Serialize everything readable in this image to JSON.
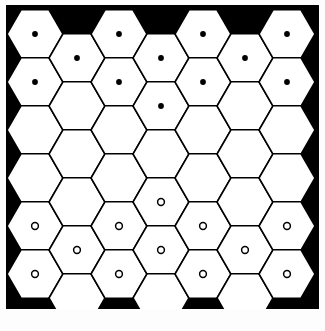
{
  "figure": {
    "background_color": "#000000",
    "cell_fill_color": "#ffffff",
    "cell_stroke_color": "#000000",
    "marker_color": "#000000",
    "panel": {
      "x": 6,
      "y": 5,
      "width": 313,
      "height": 304
    },
    "lattice": {
      "type": "hexagonal",
      "orientation": "pointy-left-right-flat-top",
      "columns": 7,
      "rows": 6,
      "column_pitch": 42,
      "row_pitch": 48,
      "hex_radius": 28,
      "origin_x": 29,
      "origin_y": 29,
      "offset_parity": "odd-columns-shifted-down-half-row"
    },
    "markers": {
      "filled_dot": {
        "name": "filled-dot",
        "radius": 2.9,
        "style": "solid"
      },
      "open_circle": {
        "name": "open-circle",
        "radius": 3.4,
        "stroke_width": 1.5,
        "style": "outline"
      }
    },
    "cells": [
      {
        "col": 0,
        "row": 0,
        "marker": "filled_dot"
      },
      {
        "col": 0,
        "row": 1,
        "marker": "filled_dot"
      },
      {
        "col": 0,
        "row": 2,
        "marker": "none"
      },
      {
        "col": 0,
        "row": 3,
        "marker": "none"
      },
      {
        "col": 0,
        "row": 4,
        "marker": "open_circle"
      },
      {
        "col": 0,
        "row": 5,
        "marker": "open_circle"
      },
      {
        "col": 1,
        "row": 0,
        "marker": "filled_dot"
      },
      {
        "col": 1,
        "row": 1,
        "marker": "none"
      },
      {
        "col": 1,
        "row": 2,
        "marker": "none"
      },
      {
        "col": 1,
        "row": 3,
        "marker": "none"
      },
      {
        "col": 1,
        "row": 4,
        "marker": "open_circle"
      },
      {
        "col": 1,
        "row": 5,
        "marker": "none"
      },
      {
        "col": 2,
        "row": 0,
        "marker": "filled_dot"
      },
      {
        "col": 2,
        "row": 1,
        "marker": "filled_dot"
      },
      {
        "col": 2,
        "row": 2,
        "marker": "none"
      },
      {
        "col": 2,
        "row": 3,
        "marker": "none"
      },
      {
        "col": 2,
        "row": 4,
        "marker": "open_circle"
      },
      {
        "col": 2,
        "row": 5,
        "marker": "open_circle"
      },
      {
        "col": 3,
        "row": 0,
        "marker": "filled_dot"
      },
      {
        "col": 3,
        "row": 1,
        "marker": "filled_dot"
      },
      {
        "col": 3,
        "row": 2,
        "marker": "none"
      },
      {
        "col": 3,
        "row": 3,
        "marker": "open_circle"
      },
      {
        "col": 3,
        "row": 4,
        "marker": "open_circle"
      },
      {
        "col": 3,
        "row": 5,
        "marker": "none"
      },
      {
        "col": 4,
        "row": 0,
        "marker": "filled_dot"
      },
      {
        "col": 4,
        "row": 1,
        "marker": "filled_dot"
      },
      {
        "col": 4,
        "row": 2,
        "marker": "none"
      },
      {
        "col": 4,
        "row": 3,
        "marker": "none"
      },
      {
        "col": 4,
        "row": 4,
        "marker": "open_circle"
      },
      {
        "col": 4,
        "row": 5,
        "marker": "open_circle"
      },
      {
        "col": 5,
        "row": 0,
        "marker": "filled_dot"
      },
      {
        "col": 5,
        "row": 1,
        "marker": "none"
      },
      {
        "col": 5,
        "row": 2,
        "marker": "none"
      },
      {
        "col": 5,
        "row": 3,
        "marker": "none"
      },
      {
        "col": 5,
        "row": 4,
        "marker": "open_circle"
      },
      {
        "col": 5,
        "row": 5,
        "marker": "none"
      },
      {
        "col": 6,
        "row": 0,
        "marker": "filled_dot"
      },
      {
        "col": 6,
        "row": 1,
        "marker": "filled_dot"
      },
      {
        "col": 6,
        "row": 2,
        "marker": "none"
      },
      {
        "col": 6,
        "row": 3,
        "marker": "none"
      },
      {
        "col": 6,
        "row": 4,
        "marker": "open_circle"
      },
      {
        "col": 6,
        "row": 5,
        "marker": "open_circle"
      }
    ],
    "counts": {
      "filled_dots": 12,
      "open_circles": 12,
      "empty_cells": 18,
      "total_cells": 42
    }
  },
  "caption": {
    "text": ""
  }
}
